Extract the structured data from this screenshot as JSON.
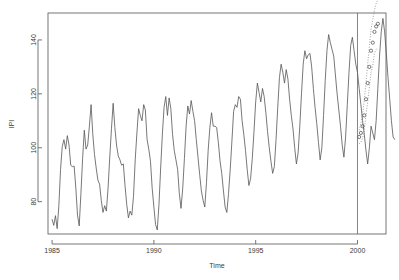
{
  "chart_data": {
    "type": "line",
    "title": "",
    "xlabel": "Time",
    "ylabel": "IPI",
    "xlim": [
      1984.8,
      2001.4
    ],
    "ylim": [
      68,
      150
    ],
    "xticks": [
      1985,
      1990,
      1995,
      2000
    ],
    "xtick_labels": [
      "1985",
      "1990",
      "1995",
      "2000"
    ],
    "yticks": [
      80,
      100,
      120,
      140
    ],
    "ytick_labels": [
      "80",
      "100",
      "120",
      "140"
    ],
    "grid": false,
    "legend": null,
    "box": true,
    "annotations": [
      {
        "name": "forecast-origin-line",
        "type": "vline",
        "x": 2000.0
      }
    ],
    "series": [
      {
        "name": "IPI observed",
        "style": "line",
        "color": "#555555",
        "x_start": 1985.0,
        "x_step": 0.08333,
        "values": [
          73.5,
          71.2,
          74.8,
          70.0,
          78.5,
          92.0,
          100.5,
          103.0,
          99.5,
          104.5,
          101.0,
          93.5,
          93.0,
          93.2,
          85.0,
          75.0,
          71.0,
          83.0,
          96.0,
          106.5,
          99.5,
          101.0,
          108.0,
          116.0,
          105.0,
          97.5,
          92.5,
          88.0,
          86.5,
          80.5,
          76.0,
          78.5,
          76.5,
          85.0,
          96.5,
          107.0,
          116.5,
          107.5,
          101.0,
          97.0,
          95.5,
          93.5,
          94.0,
          86.0,
          79.0,
          74.0,
          76.5,
          75.0,
          82.0,
          95.5,
          105.5,
          114.5,
          112.0,
          110.0,
          116.0,
          114.0,
          103.0,
          99.5,
          95.0,
          85.0,
          78.0,
          71.5,
          69.5,
          79.0,
          92.5,
          105.0,
          115.0,
          119.0,
          112.0,
          118.5,
          114.5,
          105.0,
          99.0,
          95.5,
          92.0,
          83.0,
          77.5,
          85.0,
          96.0,
          108.0,
          115.5,
          112.5,
          117.5,
          113.5,
          110.0,
          103.0,
          96.5,
          90.0,
          84.0,
          80.5,
          78.0,
          87.0,
          99.0,
          107.5,
          113.0,
          108.0,
          108.0,
          107.5,
          102.0,
          95.0,
          90.5,
          84.0,
          78.0,
          76.0,
          83.0,
          92.0,
          102.5,
          113.5,
          116.0,
          115.0,
          119.0,
          118.0,
          110.0,
          105.0,
          99.0,
          92.0,
          86.0,
          88.5,
          96.0,
          106.0,
          117.0,
          124.0,
          120.5,
          117.0,
          122.0,
          119.0,
          113.0,
          106.0,
          100.0,
          95.0,
          90.5,
          93.0,
          103.0,
          115.0,
          126.0,
          131.0,
          128.0,
          124.0,
          129.0,
          125.5,
          118.0,
          112.0,
          107.0,
          100.0,
          94.0,
          98.0,
          108.0,
          120.0,
          131.0,
          136.0,
          133.0,
          134.5,
          135.0,
          130.0,
          122.0,
          115.0,
          109.0,
          102.0,
          95.5,
          100.0,
          112.0,
          125.0,
          136.0,
          142.0,
          139.0,
          136.5,
          134.0,
          127.0,
          120.0,
          114.0,
          108.0,
          101.0,
          96.5,
          104.0,
          116.0,
          128.0,
          138.0,
          141.0,
          136.0,
          131.0,
          128.0,
          122.0,
          116.0,
          110.0,
          105.0,
          99.0,
          94.0,
          100.0,
          108.0,
          105.5,
          103.0,
          110.0,
          122.0,
          134.0,
          143.0,
          148.0,
          143.0,
          135.0,
          126.0,
          118.0,
          110.0,
          104.0,
          103.0
        ]
      },
      {
        "name": "Forecast",
        "style": "points",
        "symbol": "circle-open",
        "color": "#444444",
        "x_start": 2000.083,
        "x_step": 0.08333,
        "values": [
          104.0,
          105.5,
          108.0,
          112.0,
          118.0,
          124.0,
          130.0,
          136.0,
          139.0,
          143.0,
          145.0,
          146.0
        ]
      },
      {
        "name": "Prediction interval upper",
        "style": "dotted",
        "color": "#777777",
        "x_start": 2000.083,
        "x_step": 0.08333,
        "values": [
          106.5,
          109.0,
          112.5,
          117.5,
          124.0,
          131.0,
          137.5,
          144.0,
          147.5,
          151.0,
          153.5,
          155.0
        ]
      },
      {
        "name": "Prediction interval lower",
        "style": "dotted",
        "color": "#777777",
        "x_start": 2000.083,
        "x_step": 0.08333,
        "values": [
          101.5,
          102.0,
          103.5,
          106.5,
          112.0,
          117.0,
          122.5,
          128.0,
          130.5,
          135.0,
          136.5,
          137.0
        ]
      }
    ]
  }
}
